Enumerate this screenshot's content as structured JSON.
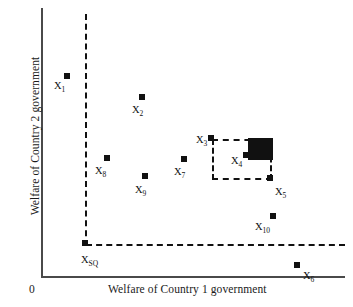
{
  "figure": {
    "type": "scatter",
    "background_color": "#ffffff",
    "marker_color": "#111111",
    "axis_color": "#4a4a4a",
    "origin_label": "0"
  },
  "axes": {
    "xlabel": "Welfare of Country 1  government",
    "ylabel": "Welfare of Country 2 government",
    "x_ticks": [],
    "y_ticks": [],
    "grid": false
  },
  "reference_lines": {
    "vertical_label": "status-quo vertical line",
    "horizontal_label": "status-quo horizontal line",
    "style": "dashed",
    "color": "#111111"
  },
  "regions": {
    "bargaining_box": {
      "label": "dashed bargaining rectangle",
      "style": "dashed",
      "color": "#111111"
    },
    "core": {
      "label": "filled core region",
      "style": "solid-fill",
      "color": "#111111"
    }
  },
  "chart_data": {
    "type": "scatter",
    "title": "",
    "xlabel": "Welfare of Country 1  government",
    "ylabel": "Welfare of Country 2 government",
    "xlim": [
      0,
      100
    ],
    "ylim": [
      0,
      100
    ],
    "grid": false,
    "legend": null,
    "annotations": [
      {
        "kind": "dashed-vline",
        "x": 14.5,
        "y_from": 12.0,
        "y_to": 97.5,
        "note": "status-quo welfare level for Country 1"
      },
      {
        "kind": "dashed-hline",
        "y": 12.0,
        "x_from": 14.5,
        "x_to": 100.0,
        "note": "status-quo welfare level for Country 2"
      },
      {
        "kind": "dashed-rect",
        "x0": 56.0,
        "y0": 35.8,
        "x1": 75.7,
        "y1": 51.1,
        "note": "bargaining set bounded by X3 and X5"
      },
      {
        "kind": "filled-rect",
        "x0": 67.8,
        "y0": 43.2,
        "x1": 76.1,
        "y1": 51.5,
        "note": "core / agreement region"
      }
    ],
    "points": [
      {
        "label": "X1",
        "sub": "1",
        "x": 8.5,
        "y": 75.0,
        "px": 67,
        "py": 76,
        "label_dx": -13,
        "label_dy": 4
      },
      {
        "label": "X2",
        "sub": "2",
        "x": 33.5,
        "y": 67.2,
        "px": 142,
        "py": 97,
        "label_dx": -10,
        "label_dy": 7
      },
      {
        "label": "X3",
        "sub": "3",
        "x": 56.3,
        "y": 51.1,
        "px": 211,
        "py": 138,
        "label_dx": -15,
        "label_dy": -4
      },
      {
        "label": "X4",
        "sub": "4",
        "x": 67.8,
        "y": 43.2,
        "px": 246,
        "py": 155,
        "label_dx": -15,
        "label_dy": 0
      },
      {
        "label": "X5",
        "sub": "5",
        "x": 76.1,
        "y": 35.8,
        "px": 270,
        "py": 178,
        "label_dx": 5,
        "label_dy": 8
      },
      {
        "label": "X6",
        "sub": "6",
        "x": 84.8,
        "y": 4.1,
        "px": 297,
        "py": 265,
        "label_dx": 6,
        "label_dy": 5
      },
      {
        "label": "X7",
        "sub": "7",
        "x": 47.5,
        "y": 44.2,
        "px": 184,
        "py": 159,
        "label_dx": -10,
        "label_dy": 7
      },
      {
        "label": "X8",
        "sub": "8",
        "x": 22.7,
        "y": 44.5,
        "px": 107,
        "py": 158,
        "label_dx": -12,
        "label_dy": 7
      },
      {
        "label": "X9",
        "sub": "9",
        "x": 34.5,
        "y": 37.9,
        "px": 145,
        "py": 176,
        "label_dx": -10,
        "label_dy": 8
      },
      {
        "label": "X10",
        "sub": "10",
        "x": 76.5,
        "y": 22.5,
        "px": 273,
        "py": 216,
        "label_dx": -18,
        "label_dy": 5
      },
      {
        "label": "XSQ",
        "sub": "SQ",
        "x": 14.5,
        "y": 12.0,
        "px": 85,
        "py": 243,
        "label_dx": -4,
        "label_dy": 11
      }
    ]
  }
}
